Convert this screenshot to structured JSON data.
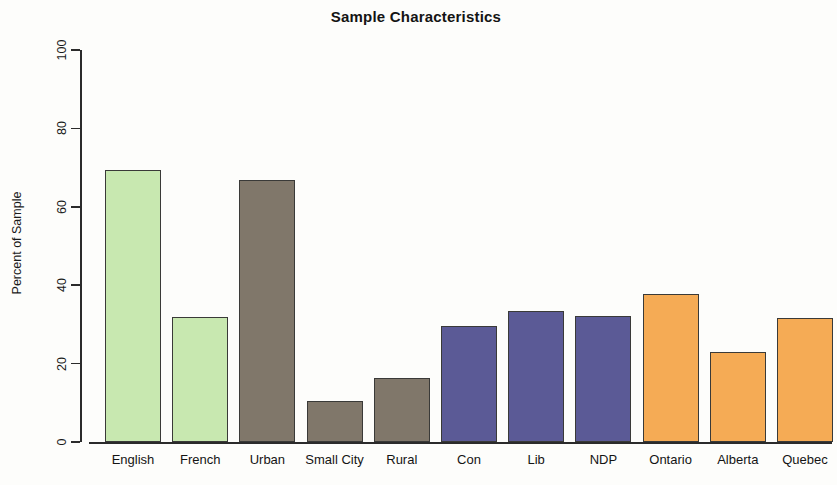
{
  "chart_data": {
    "type": "bar",
    "title": "Sample Characteristics",
    "xlabel": "",
    "ylabel": "Percent of Sample",
    "ylim": [
      0,
      100
    ],
    "yticks": [
      0,
      20,
      40,
      60,
      80,
      100
    ],
    "grid": false,
    "legend": false,
    "categories": [
      "English",
      "French",
      "Urban",
      "Small City",
      "Rural",
      "Con",
      "Lib",
      "NDP",
      "Ontario",
      "Alberta",
      "Quebec"
    ],
    "values": [
      69.4,
      31.9,
      66.8,
      10.5,
      16.4,
      29.6,
      33.4,
      32.1,
      37.8,
      23.0,
      31.6
    ],
    "colors": [
      "#c8e8b0",
      "#c8e8b0",
      "#80776a",
      "#80776a",
      "#80776a",
      "#5b5a96",
      "#5b5a96",
      "#5b5a96",
      "#f5ab55",
      "#f5ab55",
      "#f5ab55"
    ],
    "bar_border_color": "#3a3a38",
    "axis_color": "#2b2b2b",
    "background": "#fdfdfb",
    "groups": [
      {
        "name": "Language",
        "color": "#c8e8b0",
        "categories": [
          "English",
          "French"
        ]
      },
      {
        "name": "Community Size",
        "color": "#80776a",
        "categories": [
          "Urban",
          "Small City",
          "Rural"
        ]
      },
      {
        "name": "Party",
        "color": "#5b5a96",
        "categories": [
          "Con",
          "Lib",
          "NDP"
        ]
      },
      {
        "name": "Province",
        "color": "#f5ab55",
        "categories": [
          "Ontario",
          "Alberta",
          "Quebec"
        ]
      }
    ]
  }
}
